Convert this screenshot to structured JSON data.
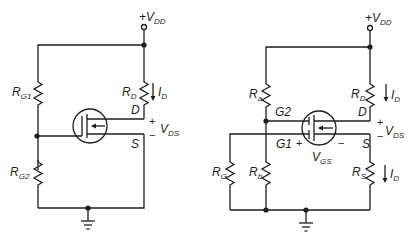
{
  "diagram": {
    "type": "circuit-schematic",
    "colors": {
      "line": "#1e1e1e",
      "background": "#ffffff"
    },
    "left_circuit": {
      "supply": {
        "sign": "+",
        "main": "V",
        "sub": "DD"
      },
      "resistors": [
        {
          "id": "RG1",
          "main": "R",
          "sub": "G1"
        },
        {
          "id": "RG2",
          "main": "R",
          "sub": "G2"
        },
        {
          "id": "RD",
          "main": "R",
          "sub": "D"
        }
      ],
      "current": {
        "main": "I",
        "sub": "D"
      },
      "terminals": {
        "drain": "D",
        "source": "S"
      },
      "vds": {
        "plus": "+",
        "minus": "−",
        "main": "V",
        "sub": "DS"
      }
    },
    "right_circuit": {
      "supply": {
        "sign": "+",
        "main": "V",
        "sub": "DD"
      },
      "resistors": [
        {
          "id": "Ra",
          "main": "R",
          "sub": "a"
        },
        {
          "id": "Rb",
          "main": "R",
          "sub": "b"
        },
        {
          "id": "RG",
          "main": "R",
          "sub": "G"
        },
        {
          "id": "RD",
          "main": "R",
          "sub": "D"
        },
        {
          "id": "RS",
          "main": "R",
          "sub": "S"
        }
      ],
      "currents": [
        {
          "main": "I",
          "sub": "D"
        },
        {
          "main": "I",
          "sub": "D"
        }
      ],
      "terminals": {
        "gate1": "G1",
        "gate2": "G2",
        "drain": "D",
        "source": "S"
      },
      "vgs": {
        "plus": "+",
        "minus": "−",
        "main": "V",
        "sub": "GS"
      },
      "vds": {
        "plus": "+",
        "minus": "−",
        "main": "V",
        "sub": "DS"
      }
    }
  }
}
